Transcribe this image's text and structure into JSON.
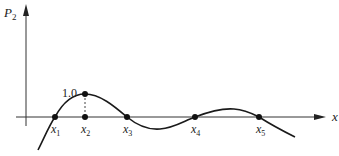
{
  "diagram": {
    "y_axis_label": "P",
    "y_axis_subscript": "2",
    "x_axis_label": "x",
    "peak_label": "1.0",
    "roots": [
      {
        "label": "x",
        "sub": "1"
      },
      {
        "label": "x",
        "sub": "2"
      },
      {
        "label": "x",
        "sub": "3"
      },
      {
        "label": "x",
        "sub": "4"
      },
      {
        "label": "x",
        "sub": "5"
      }
    ],
    "colors": {
      "curve": "#1a1a1a",
      "axis": "#333333",
      "dot": "#111111"
    }
  }
}
